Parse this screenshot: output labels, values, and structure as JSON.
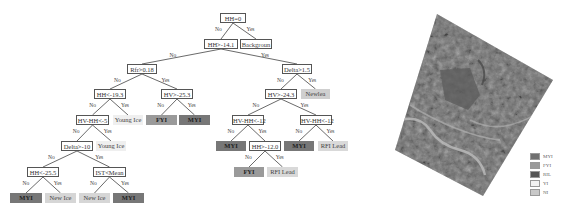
{
  "tree": {
    "nodes": [
      {
        "id": "root",
        "text": "HH=0",
        "type": "cond",
        "x": 220,
        "y": 13,
        "w": 26
      },
      {
        "id": "n1",
        "text": "HH>-14.1",
        "type": "cond",
        "x": 204,
        "y": 39,
        "w": 34
      },
      {
        "id": "bg",
        "text": "Backgroun",
        "type": "leaf",
        "x": 240,
        "y": 39,
        "w": 32,
        "color": "#ffffff",
        "border": true
      },
      {
        "id": "n2",
        "text": "Rfr>0.18",
        "type": "cond",
        "x": 127,
        "y": 64,
        "w": 30
      },
      {
        "id": "n3",
        "text": "Delta>1.5",
        "type": "cond",
        "x": 282,
        "y": 64,
        "w": 30
      },
      {
        "id": "n4",
        "text": "HH<-19.3",
        "type": "cond",
        "x": 94,
        "y": 89,
        "w": 32
      },
      {
        "id": "n5",
        "text": "HV>-25.3",
        "type": "cond",
        "x": 161,
        "y": 89,
        "w": 32
      },
      {
        "id": "n6",
        "text": "HV>-24.3",
        "type": "cond",
        "x": 265,
        "y": 89,
        "w": 32
      },
      {
        "id": "l_newlea",
        "text": "Newlea",
        "type": "leaf",
        "x": 301,
        "y": 89,
        "w": 29,
        "color": "#cfcfcf"
      },
      {
        "id": "n7",
        "text": "HV-HH<-5",
        "type": "cond",
        "x": 76,
        "y": 115,
        "w": 33
      },
      {
        "id": "l_young1",
        "text": "Young Ice",
        "type": "leaf",
        "x": 113,
        "y": 115,
        "w": 30,
        "color": "#efefef"
      },
      {
        "id": "l_fyi1",
        "text": "FYI",
        "type": "leaf",
        "x": 146,
        "y": 115,
        "w": 31,
        "color": "#9a9a9a"
      },
      {
        "id": "l_myi1",
        "text": "MYI",
        "type": "leaf",
        "x": 179,
        "y": 115,
        "w": 31,
        "color": "#777777"
      },
      {
        "id": "n8",
        "text": "HV-HH<-12",
        "type": "cond",
        "x": 232,
        "y": 115,
        "w": 32
      },
      {
        "id": "n9",
        "text": "HV-HH<-12",
        "type": "cond",
        "x": 300,
        "y": 115,
        "w": 32
      },
      {
        "id": "n10",
        "text": "Delta>-10",
        "type": "cond",
        "x": 61,
        "y": 141,
        "w": 32
      },
      {
        "id": "l_young2",
        "text": "Young Ice",
        "type": "leaf",
        "x": 96,
        "y": 141,
        "w": 30,
        "color": "#efefef"
      },
      {
        "id": "l_myi2",
        "text": "MYI",
        "type": "leaf",
        "x": 216,
        "y": 141,
        "w": 30,
        "color": "#777777"
      },
      {
        "id": "n11",
        "text": "HH>-12.0",
        "type": "cond",
        "x": 249,
        "y": 141,
        "w": 32
      },
      {
        "id": "l_myi3",
        "text": "MYI",
        "type": "leaf",
        "x": 284,
        "y": 141,
        "w": 30,
        "color": "#777777"
      },
      {
        "id": "l_rfi1",
        "text": "RFI Lead",
        "type": "leaf",
        "x": 318,
        "y": 141,
        "w": 30,
        "color": "#d9d9d9"
      },
      {
        "id": "l_fyi2",
        "text": "FYI",
        "type": "leaf",
        "x": 234,
        "y": 167,
        "w": 30,
        "color": "#9a9a9a"
      },
      {
        "id": "l_rfi2",
        "text": "RFI Lead",
        "type": "leaf",
        "x": 267,
        "y": 167,
        "w": 31,
        "color": "#d9d9d9"
      },
      {
        "id": "n12",
        "text": "HH<-25.5",
        "type": "cond",
        "x": 27,
        "y": 167,
        "w": 32
      },
      {
        "id": "n13",
        "text": "IST<Mean",
        "type": "cond",
        "x": 93,
        "y": 167,
        "w": 33
      },
      {
        "id": "l_myi4",
        "text": "MYI",
        "type": "leaf",
        "x": 10,
        "y": 193,
        "w": 32,
        "color": "#777777"
      },
      {
        "id": "l_new1",
        "text": "New Ice",
        "type": "leaf",
        "x": 45,
        "y": 193,
        "w": 31,
        "color": "#d6d6d6"
      },
      {
        "id": "l_new2",
        "text": "New Ice",
        "type": "leaf",
        "x": 79,
        "y": 193,
        "w": 31,
        "color": "#d6d6d6"
      },
      {
        "id": "l_myi5",
        "text": "MYI",
        "type": "leaf",
        "x": 113,
        "y": 193,
        "w": 31,
        "color": "#777777"
      }
    ],
    "edges": [
      {
        "from": "root",
        "to": "n1",
        "label": "No"
      },
      {
        "from": "root",
        "to": "bg",
        "label": "Yes"
      },
      {
        "from": "n1",
        "to": "n2",
        "label": "No"
      },
      {
        "from": "n1",
        "to": "n3",
        "label": "Yes"
      },
      {
        "from": "n2",
        "to": "n4",
        "label": "No"
      },
      {
        "from": "n2",
        "to": "n5",
        "label": "Yes"
      },
      {
        "from": "n3",
        "to": "n6",
        "label": "No"
      },
      {
        "from": "n3",
        "to": "l_newlea",
        "label": "Yes"
      },
      {
        "from": "n4",
        "to": "n7",
        "label": "No"
      },
      {
        "from": "n4",
        "to": "l_young1",
        "label": "Yes"
      },
      {
        "from": "n5",
        "to": "l_fyi1",
        "label": "No"
      },
      {
        "from": "n5",
        "to": "l_myi1",
        "label": "Yes"
      },
      {
        "from": "n6",
        "to": "n8",
        "label": "No"
      },
      {
        "from": "n6",
        "to": "n9",
        "label": "Yes"
      },
      {
        "from": "n7",
        "to": "n10",
        "label": "No"
      },
      {
        "from": "n7",
        "to": "l_young2",
        "label": "Yes"
      },
      {
        "from": "n8",
        "to": "l_myi2",
        "label": "No"
      },
      {
        "from": "n8",
        "to": "n11",
        "label": "Yes"
      },
      {
        "from": "n9",
        "to": "l_myi3",
        "label": "No"
      },
      {
        "from": "n9",
        "to": "l_rfi1",
        "label": "Yes"
      },
      {
        "from": "n11",
        "to": "l_fyi2",
        "label": "No"
      },
      {
        "from": "n11",
        "to": "l_rfi2",
        "label": "Yes"
      },
      {
        "from": "n10",
        "to": "n12",
        "label": "No"
      },
      {
        "from": "n10",
        "to": "n13",
        "label": "Yes"
      },
      {
        "from": "n12",
        "to": "l_myi4",
        "label": "No"
      },
      {
        "from": "n12",
        "to": "l_new1",
        "label": "Yes"
      },
      {
        "from": "n13",
        "to": "l_new2",
        "label": "No"
      },
      {
        "from": "n13",
        "to": "l_myi5",
        "label": "Yes"
      }
    ]
  },
  "classification_map": {
    "polygon": [
      [
        437,
        14
      ],
      [
        553,
        80
      ],
      [
        483,
        196
      ],
      [
        395,
        150
      ]
    ],
    "base_color": "#707070"
  },
  "legend": {
    "items": [
      {
        "label": "MYI",
        "color": "#707070"
      },
      {
        "label": "FYI",
        "color": "#9a9a9a"
      },
      {
        "label": "RIL",
        "color": "#555555"
      },
      {
        "label": "YI",
        "color": "#f2f2f2"
      },
      {
        "label": "NI",
        "color": "#c8c8c8"
      }
    ]
  }
}
